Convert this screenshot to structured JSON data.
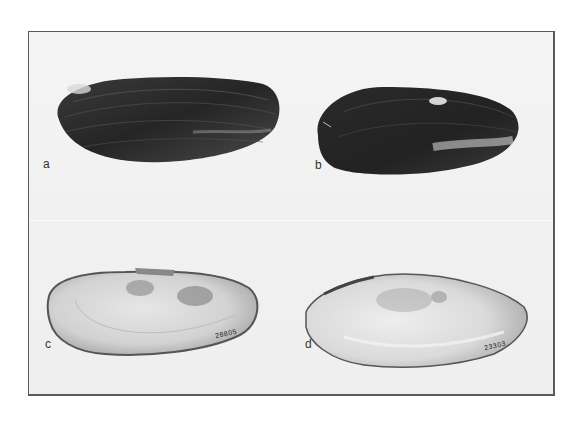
{
  "figure": {
    "panels": [
      {
        "id": "a",
        "label": "a",
        "view": "exterior",
        "tone": "dark"
      },
      {
        "id": "b",
        "label": "b",
        "view": "exterior",
        "tone": "dark"
      },
      {
        "id": "c",
        "label": "c",
        "view": "interior",
        "tone": "light",
        "catalog_number": "28805"
      },
      {
        "id": "d",
        "label": "d",
        "view": "interior",
        "tone": "light",
        "catalog_number": "23303"
      }
    ],
    "colors": {
      "frame": "#5a5a5a",
      "background": "#f2f2f2",
      "shell_exterior": "#2e2e2e",
      "shell_interior": "#d9d9d9"
    }
  }
}
